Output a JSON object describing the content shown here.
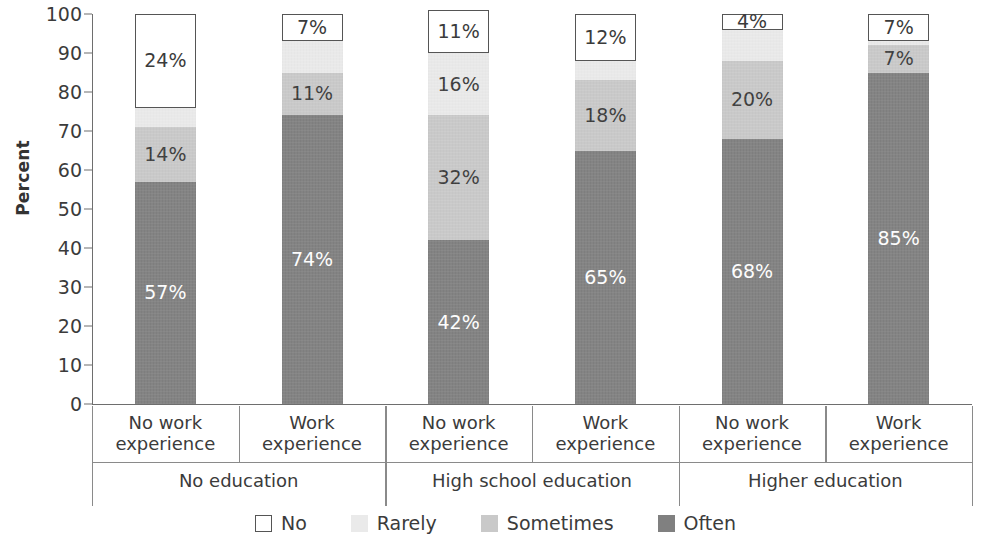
{
  "chart_data": {
    "type": "bar",
    "subtype": "stacked-column-100",
    "title": "",
    "xlabel": "",
    "ylabel": "Percent",
    "ylim": [
      0,
      100
    ],
    "yticks": [
      0,
      10,
      20,
      30,
      40,
      50,
      60,
      70,
      80,
      90,
      100
    ],
    "grid": false,
    "legend_position": "bottom",
    "categories": [
      "No work experience",
      "Work experience",
      "No work experience",
      "Work experience",
      "No work experience",
      "Work experience"
    ],
    "groups": [
      {
        "label": "No education",
        "categories": [
          "No work experience",
          "Work experience"
        ]
      },
      {
        "label": "High school education",
        "categories": [
          "No work experience",
          "Work experience"
        ]
      },
      {
        "label": "Higher education",
        "categories": [
          "No work experience",
          "Work experience"
        ]
      }
    ],
    "series": [
      {
        "name": "Often",
        "color": "#808080",
        "values": [
          57,
          74,
          42,
          65,
          68,
          85
        ]
      },
      {
        "name": "Sometimes",
        "color": "#c9c9c9",
        "values": [
          14,
          11,
          32,
          18,
          20,
          7
        ]
      },
      {
        "name": "Rarely",
        "color": "#eaeaea",
        "values": [
          5,
          8,
          16,
          5,
          8,
          1
        ]
      },
      {
        "name": "No",
        "color": "#ffffff",
        "values": [
          24,
          7,
          11,
          12,
          4,
          7
        ]
      }
    ],
    "data_labels": [
      {
        "bar": 0,
        "series": "Often",
        "text": "57%"
      },
      {
        "bar": 0,
        "series": "Sometimes",
        "text": "14%"
      },
      {
        "bar": 0,
        "series": "No",
        "text": "24%"
      },
      {
        "bar": 1,
        "series": "Often",
        "text": "74%"
      },
      {
        "bar": 1,
        "series": "Sometimes",
        "text": "11%"
      },
      {
        "bar": 1,
        "series": "No",
        "text": "7%"
      },
      {
        "bar": 2,
        "series": "Often",
        "text": "42%"
      },
      {
        "bar": 2,
        "series": "Sometimes",
        "text": "32%"
      },
      {
        "bar": 2,
        "series": "Rarely",
        "text": "16%"
      },
      {
        "bar": 2,
        "series": "No",
        "text": "11%"
      },
      {
        "bar": 3,
        "series": "Often",
        "text": "65%"
      },
      {
        "bar": 3,
        "series": "Sometimes",
        "text": "18%"
      },
      {
        "bar": 3,
        "series": "No",
        "text": "12%"
      },
      {
        "bar": 4,
        "series": "Often",
        "text": "68%"
      },
      {
        "bar": 4,
        "series": "Sometimes",
        "text": "20%"
      },
      {
        "bar": 4,
        "series": "No",
        "text": "4%"
      },
      {
        "bar": 5,
        "series": "Often",
        "text": "85%"
      },
      {
        "bar": 5,
        "series": "Sometimes",
        "text": "7%"
      },
      {
        "bar": 5,
        "series": "No",
        "text": "7%"
      }
    ]
  },
  "axis": {
    "y_title": "Percent",
    "y_ticks": [
      "100",
      "90",
      "80",
      "70",
      "60",
      "50",
      "40",
      "30",
      "20",
      "10",
      "0"
    ]
  },
  "bars": [
    {
      "category": "No work experience",
      "group": "No education",
      "segments": [
        {
          "series": "No",
          "value": 24,
          "label": "24%",
          "show_label": true
        },
        {
          "series": "Rarely",
          "value": 5,
          "label": "5%",
          "show_label": false
        },
        {
          "series": "Sometimes",
          "value": 14,
          "label": "14%",
          "show_label": true
        },
        {
          "series": "Often",
          "value": 57,
          "label": "57%",
          "show_label": true
        }
      ]
    },
    {
      "category": "Work experience",
      "group": "No education",
      "segments": [
        {
          "series": "No",
          "value": 7,
          "label": "7%",
          "show_label": true
        },
        {
          "series": "Rarely",
          "value": 8,
          "label": "8%",
          "show_label": false
        },
        {
          "series": "Sometimes",
          "value": 11,
          "label": "11%",
          "show_label": true
        },
        {
          "series": "Often",
          "value": 74,
          "label": "74%",
          "show_label": true
        }
      ]
    },
    {
      "category": "No work experience",
      "group": "High school education",
      "segments": [
        {
          "series": "No",
          "value": 11,
          "label": "11%",
          "show_label": true
        },
        {
          "series": "Rarely",
          "value": 16,
          "label": "16%",
          "show_label": true
        },
        {
          "series": "Sometimes",
          "value": 32,
          "label": "32%",
          "show_label": true
        },
        {
          "series": "Often",
          "value": 42,
          "label": "42%",
          "show_label": true
        }
      ]
    },
    {
      "category": "Work experience",
      "group": "High school education",
      "segments": [
        {
          "series": "No",
          "value": 12,
          "label": "12%",
          "show_label": true
        },
        {
          "series": "Rarely",
          "value": 5,
          "label": "5%",
          "show_label": false
        },
        {
          "series": "Sometimes",
          "value": 18,
          "label": "18%",
          "show_label": true
        },
        {
          "series": "Often",
          "value": 65,
          "label": "65%",
          "show_label": true
        }
      ]
    },
    {
      "category": "No work experience",
      "group": "Higher education",
      "segments": [
        {
          "series": "No",
          "value": 4,
          "label": "4%",
          "show_label": true
        },
        {
          "series": "Rarely",
          "value": 8,
          "label": "8%",
          "show_label": false
        },
        {
          "series": "Sometimes",
          "value": 20,
          "label": "20%",
          "show_label": true
        },
        {
          "series": "Often",
          "value": 68,
          "label": "68%",
          "show_label": true
        }
      ]
    },
    {
      "category": "Work experience",
      "group": "Higher education",
      "segments": [
        {
          "series": "No",
          "value": 7,
          "label": "7%",
          "show_label": true
        },
        {
          "series": "Rarely",
          "value": 1,
          "label": "1%",
          "show_label": false
        },
        {
          "series": "Sometimes",
          "value": 7,
          "label": "7%",
          "show_label": true
        },
        {
          "series": "Often",
          "value": 85,
          "label": "85%",
          "show_label": true
        }
      ]
    }
  ],
  "x_axis_tier1": [
    "No work experience",
    "Work experience",
    "No work experience",
    "Work experience",
    "No work experience",
    "Work experience"
  ],
  "x_axis_tier2": [
    "No education",
    "High school education",
    "Higher education"
  ],
  "legend": {
    "items": [
      {
        "label": "No",
        "color": "#ffffff",
        "swatch": "sw-no"
      },
      {
        "label": "Rarely",
        "color": "#eaeaea",
        "swatch": "sw-rarely"
      },
      {
        "label": "Sometimes",
        "color": "#c9c9c9",
        "swatch": "sw-sometimes"
      },
      {
        "label": "Often",
        "color": "#808080",
        "swatch": "sw-often"
      }
    ]
  }
}
